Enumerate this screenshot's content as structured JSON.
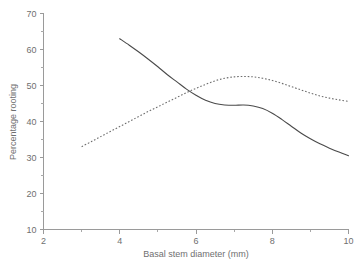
{
  "chart_data": {
    "type": "line",
    "title": "",
    "subtitle": "",
    "xlabel": "Basal stem diameter (mm)",
    "ylabel": "Percentage rooting",
    "xlim": [
      2,
      10
    ],
    "ylim": [
      10,
      70
    ],
    "xticks": [
      2,
      4,
      6,
      8,
      10
    ],
    "xticklabels": [
      "2",
      "4",
      "6",
      "8",
      "10"
    ],
    "xminorticks": [
      3,
      5,
      7,
      9
    ],
    "yticks": [
      10,
      20,
      30,
      40,
      50,
      60,
      70
    ],
    "yticklabels": [
      "10",
      "20",
      "30",
      "40",
      "50",
      "60",
      "70"
    ],
    "yminorticks": [
      15,
      25,
      35,
      45,
      55,
      65
    ],
    "grid": false,
    "legend": "none",
    "series": [
      {
        "name": "solid-curve",
        "style": "solid",
        "color": "#4a4a4a",
        "x": [
          4.0,
          4.25,
          4.5,
          4.75,
          5.0,
          5.25,
          5.5,
          5.75,
          6.0,
          6.25,
          6.5,
          6.75,
          7.0,
          7.25,
          7.5,
          7.75,
          8.0,
          8.25,
          8.5,
          8.75,
          9.0,
          9.25,
          9.5,
          9.75,
          10.0
        ],
        "y": [
          63.0,
          61.2,
          59.3,
          57.3,
          55.2,
          53.0,
          51.0,
          49.0,
          47.3,
          45.9,
          45.0,
          44.6,
          44.5,
          44.6,
          44.3,
          43.6,
          42.3,
          40.6,
          38.7,
          36.8,
          35.2,
          33.8,
          32.6,
          31.5,
          30.5
        ]
      },
      {
        "name": "dotted-curve",
        "style": "dotted",
        "color": "#6d6d6d",
        "x": [
          3.0,
          3.25,
          3.5,
          3.75,
          4.0,
          4.25,
          4.5,
          4.75,
          5.0,
          5.25,
          5.5,
          5.75,
          6.0,
          6.25,
          6.5,
          6.75,
          7.0,
          7.25,
          7.5,
          7.75,
          8.0,
          8.25,
          8.5,
          8.75,
          9.0,
          9.25,
          9.5,
          9.75,
          10.0
        ],
        "y": [
          33.0,
          34.4,
          35.8,
          37.2,
          38.6,
          40.0,
          41.4,
          42.8,
          44.1,
          45.4,
          46.7,
          48.0,
          49.2,
          50.3,
          51.3,
          52.0,
          52.4,
          52.5,
          52.4,
          52.0,
          51.4,
          50.6,
          49.7,
          48.8,
          47.9,
          47.1,
          46.5,
          46.0,
          45.6
        ]
      }
    ],
    "annotations": []
  },
  "colors": {
    "axis": "#9a9a9a",
    "text": "#6f6f6f",
    "background": "#ffffff"
  }
}
